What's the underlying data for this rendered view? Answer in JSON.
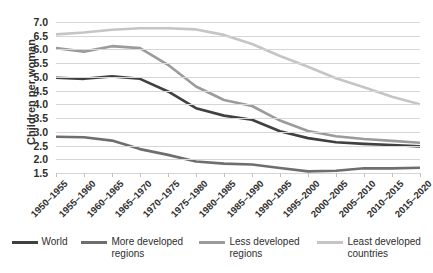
{
  "chart_data": {
    "type": "line",
    "title": "",
    "xlabel": "",
    "ylabel": "Children per woman",
    "ylim": [
      1.5,
      7.0
    ],
    "ytick_step": 0.5,
    "grid": true,
    "legend_position": "bottom",
    "categories": [
      "1950–1955",
      "1955–1960",
      "1960–1965",
      "1965–1970",
      "1970–1975",
      "1975–1980",
      "1980–1985",
      "1985–1990",
      "1990–1995",
      "1995–2000",
      "2000–2005",
      "2005–2010",
      "2010–2015",
      "2015–2020"
    ],
    "ytick_labels": [
      "7.0",
      "6.5",
      "6.0",
      "5.5",
      "5.0",
      "4.5",
      "4.0",
      "3.5",
      "3.0",
      "2.5",
      "2.0",
      "1.5"
    ],
    "series": [
      {
        "name": "World",
        "color": "#404040",
        "values": [
          4.97,
          4.93,
          5.02,
          4.93,
          4.47,
          3.86,
          3.59,
          3.44,
          3.02,
          2.77,
          2.62,
          2.56,
          2.52,
          2.47
        ]
      },
      {
        "name": "More developed regions",
        "color": "#6e6e6e",
        "values": [
          2.82,
          2.8,
          2.68,
          2.37,
          2.16,
          1.92,
          1.84,
          1.81,
          1.68,
          1.56,
          1.58,
          1.67,
          1.67,
          1.69
        ]
      },
      {
        "name": "Less developed regions",
        "color": "#9b9b9b",
        "values": [
          6.05,
          5.92,
          6.12,
          6.05,
          5.44,
          4.65,
          4.16,
          3.94,
          3.41,
          3.03,
          2.84,
          2.74,
          2.67,
          2.6
        ]
      },
      {
        "name": "Least developed countries",
        "color": "#c5c5c5",
        "values": [
          6.55,
          6.62,
          6.72,
          6.77,
          6.77,
          6.73,
          6.53,
          6.2,
          5.76,
          5.37,
          4.95,
          4.62,
          4.28,
          4.0
        ]
      }
    ]
  },
  "legend": {
    "items": [
      {
        "label": "World",
        "color": "#404040"
      },
      {
        "label": "More developed regions",
        "color": "#6e6e6e"
      },
      {
        "label": "Less developed regions",
        "color": "#9b9b9b"
      },
      {
        "label": "Least developed countries",
        "color": "#c5c5c5"
      }
    ]
  }
}
